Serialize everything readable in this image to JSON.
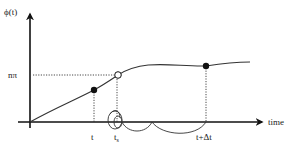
{
  "diagram": {
    "y_axis_label": "ϕ(t)",
    "x_axis_label": "time",
    "level_label": "nπ",
    "tick_labels": {
      "t": "t",
      "t_s_base": "t",
      "t_s_sub": "s",
      "t_plus_dt": "t+Δt"
    },
    "points": [
      {
        "name": "phase-at-t",
        "style": "filled"
      },
      {
        "name": "phase-crossing-npi",
        "style": "open"
      },
      {
        "name": "phase-at-t-plus-dt",
        "style": "filled"
      }
    ],
    "colors": {
      "ink": "#111111",
      "background": "#ffffff"
    }
  }
}
